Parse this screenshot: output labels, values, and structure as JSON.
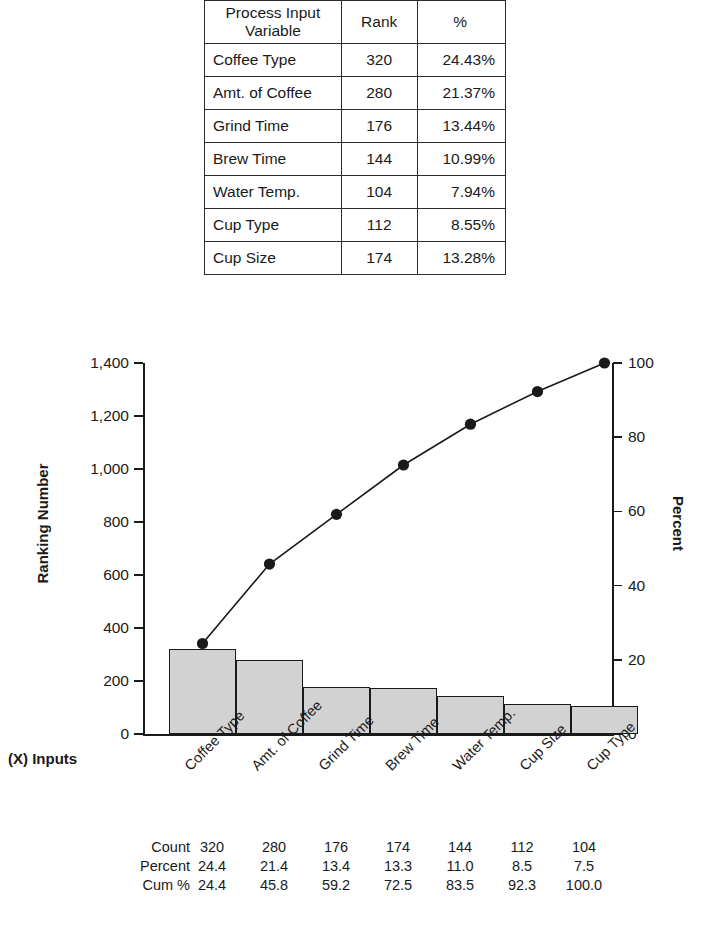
{
  "summary_table": {
    "headers": [
      "Process Input Variable",
      "Rank",
      "%"
    ],
    "rows": [
      {
        "variable": "Coffee Type",
        "rank": "320",
        "percent": "24.43%"
      },
      {
        "variable": "Amt. of Coffee",
        "rank": "280",
        "percent": "21.37%"
      },
      {
        "variable": "Grind Time",
        "rank": "176",
        "percent": "13.44%"
      },
      {
        "variable": "Brew Time",
        "rank": "144",
        "percent": "10.99%"
      },
      {
        "variable": "Water Temp.",
        "rank": "104",
        "percent": "7.94%"
      },
      {
        "variable": "Cup Type",
        "rank": "112",
        "percent": "8.55%"
      },
      {
        "variable": "Cup Size",
        "rank": "174",
        "percent": "13.28%"
      }
    ]
  },
  "chart_data": {
    "type": "bar",
    "title": "",
    "xlabel": "(X) Inputs",
    "ylabel": "Ranking Number",
    "y2label": "Percent",
    "categories": [
      "Coffee Type",
      "Amt. of Coffee",
      "Grind Time",
      "Brew Time",
      "Water Temp.",
      "Cup Size",
      "Cup Type"
    ],
    "values": [
      320,
      280,
      176,
      174,
      144,
      112,
      104
    ],
    "cumulative_percent": [
      24.4,
      45.8,
      59.2,
      72.5,
      83.5,
      92.3,
      100.0
    ],
    "ylim": [
      0,
      1400
    ],
    "y2lim": [
      0,
      100
    ],
    "yticks": [
      "0",
      "200",
      "400",
      "600",
      "800",
      "1,000",
      "1,200",
      "1,400"
    ],
    "ytick_values": [
      0,
      200,
      400,
      600,
      800,
      1000,
      1200,
      1400
    ],
    "y2ticks": [
      "0",
      "20",
      "40",
      "60",
      "80",
      "100"
    ],
    "y2tick_values": [
      0,
      20,
      40,
      60,
      80,
      100
    ],
    "grid": false,
    "legend": "none",
    "bar_color": "#d2d2d2",
    "line_color": "#1a1a1a"
  },
  "stats_table": {
    "row_labels": [
      "Count",
      "Percent",
      "Cum %"
    ],
    "count": [
      "320",
      "280",
      "176",
      "174",
      "144",
      "112",
      "104"
    ],
    "percent": [
      "24.4",
      "21.4",
      "13.4",
      "13.3",
      "11.0",
      "8.5",
      "7.5"
    ],
    "cum": [
      "24.4",
      "45.8",
      "59.2",
      "72.5",
      "83.5",
      "92.3",
      "100.0"
    ]
  }
}
